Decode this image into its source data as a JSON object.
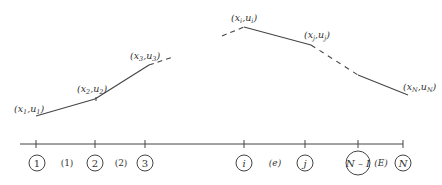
{
  "diagram": {
    "curve": {
      "points": [
        {
          "id": "p1",
          "x": 36,
          "y": 116,
          "label_x": "x",
          "label_u": "u",
          "sub": "1"
        },
        {
          "id": "p2",
          "x": 95,
          "y": 99,
          "label_x": "x",
          "label_u": "u",
          "sub": "2"
        },
        {
          "id": "p3",
          "x": 149,
          "y": 65,
          "label_x": "x",
          "label_u": "u",
          "sub": "3"
        },
        {
          "id": "pi",
          "x": 244,
          "y": 27,
          "label_x": "x",
          "label_u": "u",
          "sub": "i"
        },
        {
          "id": "pj",
          "x": 311,
          "y": 45,
          "label_x": "x",
          "label_u": "u",
          "sub": "j"
        },
        {
          "id": "pN",
          "x": 408,
          "y": 95,
          "label_x": "x",
          "label_u": "u",
          "sub": "N"
        }
      ],
      "point_labels": [
        "(x1,u1)",
        "(x2,u2)",
        "(x3,u3)",
        "(xi,ui)",
        "(xj,uj)",
        "(xN,uN)"
      ]
    },
    "axis": {
      "nodes": [
        {
          "label": "1",
          "italic": false
        },
        {
          "label": "2",
          "italic": false
        },
        {
          "label": "3",
          "italic": false
        },
        {
          "label": "i",
          "italic": true
        },
        {
          "label": "j",
          "italic": true
        },
        {
          "label": "N – I",
          "italic": true
        },
        {
          "label": "N",
          "italic": true
        }
      ],
      "elements": [
        {
          "label": "(1)",
          "italic": false
        },
        {
          "label": "(2)",
          "italic": false
        },
        {
          "label": "(e)",
          "italic": true
        },
        {
          "label": "(E)",
          "italic": true
        }
      ]
    }
  }
}
